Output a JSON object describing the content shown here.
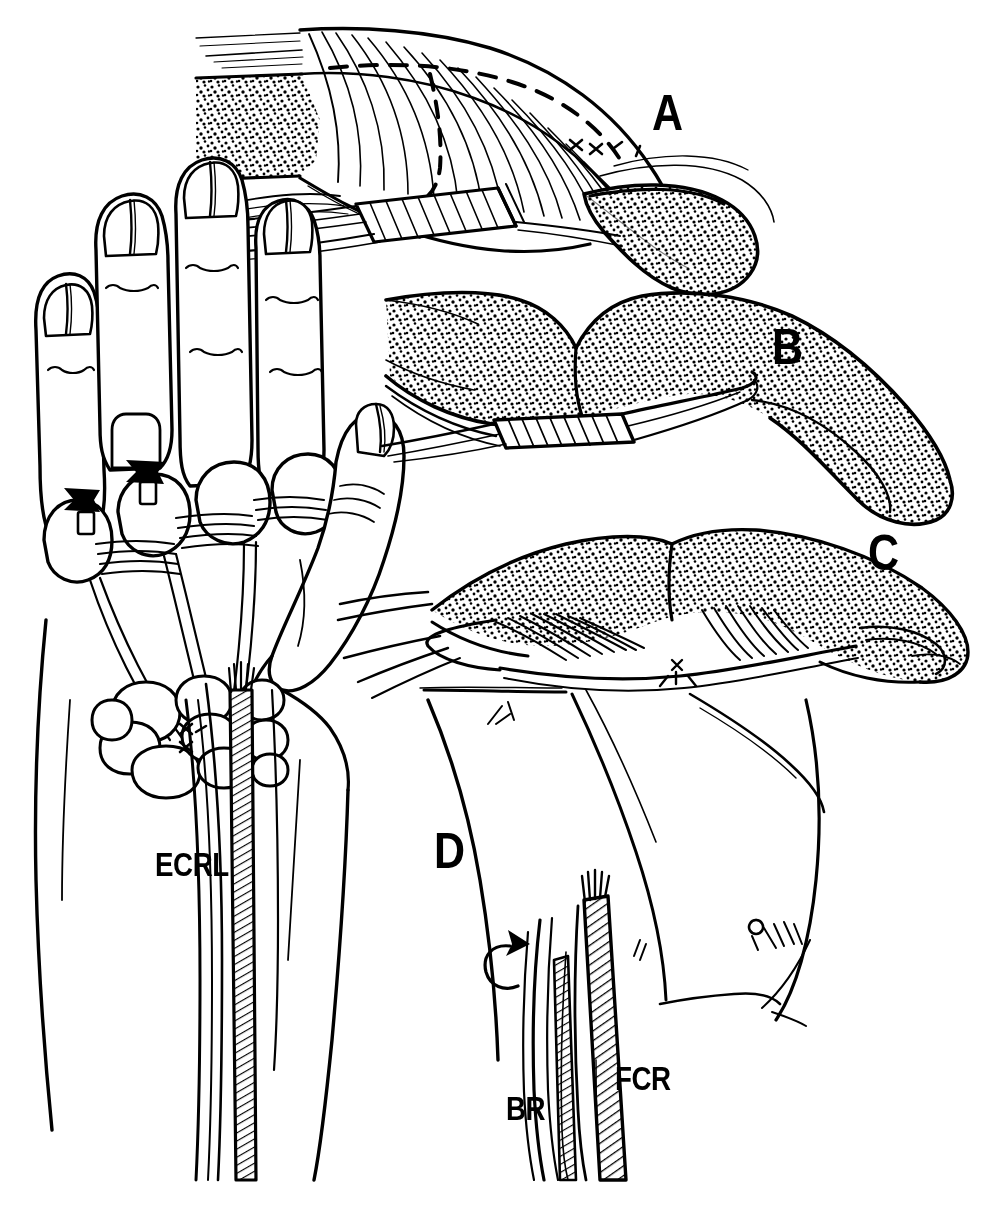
{
  "figure": {
    "type": "medical-line-illustration",
    "background_color": "#ffffff",
    "ink_color": "#000000",
    "width": 989,
    "height": 1208
  },
  "panels": [
    {
      "id": "A",
      "letter": "A",
      "name": "panel-a",
      "caption": ""
    },
    {
      "id": "B",
      "letter": "B",
      "name": "panel-b",
      "caption": ""
    },
    {
      "id": "C",
      "letter": "C",
      "name": "panel-c",
      "caption": ""
    },
    {
      "id": "D",
      "letter": "D",
      "name": "panel-d",
      "caption": ""
    }
  ],
  "anatomical_labels": [
    {
      "id": "ecrl",
      "text": "ECRL"
    },
    {
      "id": "br",
      "text": "BR"
    },
    {
      "id": "fcr",
      "text": "FCR"
    }
  ],
  "illustration_elements": {
    "hand_dorsum": "dorsal-hand-view",
    "fingers": "index-middle-ring-little-fingers",
    "thumb": "thumb",
    "arrows": "black-solid-arrows",
    "tendon_graft": "hatched-tendon-strip",
    "dashed_line": "dashed-incision-line",
    "stipple": "stippled-soft-tissue-shading",
    "suture": "suture-knot-marks"
  }
}
